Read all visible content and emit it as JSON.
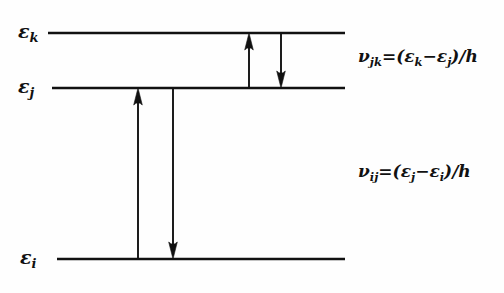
{
  "figure": {
    "type": "energy-level-diagram",
    "background_color": "#fefefe",
    "ink_color": "#111111",
    "width": 504,
    "height": 293
  },
  "levels": [
    {
      "id": "k",
      "symbol": "ε",
      "subscript": "k",
      "label_text": "εk",
      "y": 33,
      "x_start": 48,
      "x_end": 345,
      "label_x": 18,
      "label_y": 22
    },
    {
      "id": "j",
      "symbol": "ε",
      "subscript": "j",
      "label_text": "εj",
      "y": 88,
      "x_start": 52,
      "x_end": 345,
      "label_x": 18,
      "label_y": 77
    },
    {
      "id": "i",
      "symbol": "ε",
      "subscript": "i",
      "label_text": "εi",
      "y": 259,
      "x_start": 57,
      "x_end": 345,
      "label_x": 20,
      "label_y": 248
    }
  ],
  "transitions": [
    {
      "name": "absorption-j-to-k",
      "direction": "up",
      "x": 249,
      "from_level": "j",
      "to_level": "k",
      "y_tail": 88,
      "y_head": 33
    },
    {
      "name": "emission-k-to-j",
      "direction": "down",
      "x": 281,
      "from_level": "k",
      "to_level": "j",
      "y_tail": 33,
      "y_head": 88
    },
    {
      "name": "absorption-i-to-j",
      "direction": "up",
      "x": 138,
      "from_level": "i",
      "to_level": "j",
      "y_tail": 259,
      "y_head": 88
    },
    {
      "name": "emission-j-to-i",
      "direction": "down",
      "x": 173,
      "from_level": "j",
      "to_level": "i",
      "y_tail": 88,
      "y_head": 259
    }
  ],
  "formulas": [
    {
      "name": "frequency-jk",
      "x": 358,
      "y": 48,
      "parts": {
        "nu": "ν",
        "nu_sub": "jk",
        "equals": "=(",
        "eps1": "ε",
        "eps1_sub": "k",
        "minus": "−",
        "eps2": "ε",
        "eps2_sub": "j",
        "tail": ")/h"
      },
      "plain": "νjk=(εk−εj)/h"
    },
    {
      "name": "frequency-ij",
      "x": 358,
      "y": 163,
      "parts": {
        "nu": "ν",
        "nu_sub": "ij",
        "equals": "=(",
        "eps1": "ε",
        "eps1_sub": "j",
        "minus": "−",
        "eps2": "ε",
        "eps2_sub": "i",
        "tail": ")/h"
      },
      "plain": "νij=(εj−εi)/h"
    }
  ]
}
